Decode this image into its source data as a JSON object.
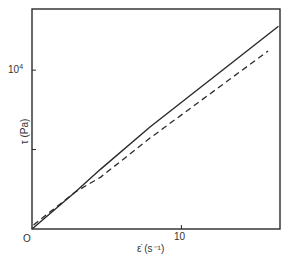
{
  "chart_data": {
    "type": "line",
    "title": "",
    "xlabel": "ε̇ (s⁻¹)",
    "ylabel": "τ (Pa)",
    "xlim": [
      0,
      16.6
    ],
    "ylim": [
      0,
      13850
    ],
    "x_ticks": [
      {
        "value": 0,
        "label": "O"
      },
      {
        "value": 10,
        "label": "10"
      }
    ],
    "y_ticks": [
      {
        "value": 5000,
        "label": ""
      },
      {
        "value": 10000,
        "label": "10⁴"
      }
    ],
    "grid": false,
    "legend": null,
    "series": [
      {
        "name": "solid",
        "style": "solid",
        "color": "#2a2a2a",
        "x": [
          0,
          2.9,
          4.6,
          7.9,
          16.5
        ],
        "y": [
          0,
          2330,
          3770,
          6420,
          12770
        ]
      },
      {
        "name": "dashed",
        "style": "dashed",
        "color": "#2a2a2a",
        "x": [
          0.1,
          2.9,
          4.6,
          7.9,
          15.8
        ],
        "y": [
          250,
          2330,
          3270,
          5720,
          11200
        ]
      }
    ]
  },
  "labels": {
    "origin": "O",
    "x_tick_10": "10",
    "y_tick_base": "10",
    "y_tick_exp": "4",
    "xlabel": "ε̇ (s⁻¹)",
    "ylabel": "τ (Pa)"
  }
}
